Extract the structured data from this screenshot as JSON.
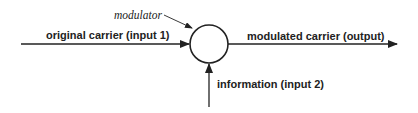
{
  "diagram": {
    "type": "block-diagram",
    "node": {
      "label": "modulator",
      "shape": "circle"
    },
    "inputs": [
      {
        "id": "input1",
        "label": "original carrier (input 1)",
        "direction": "from-left"
      },
      {
        "id": "input2",
        "label": "information (input 2)",
        "direction": "from-bottom"
      }
    ],
    "output": {
      "label": "modulated carrier (output)",
      "direction": "to-right"
    },
    "colors": {
      "stroke": "#222222",
      "background": "#ffffff"
    }
  }
}
